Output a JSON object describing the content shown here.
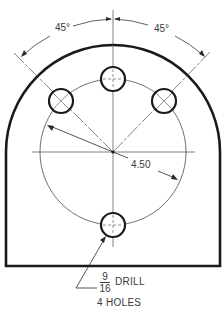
{
  "drawing": {
    "type": "engineering-drawing",
    "angle_labels": [
      "45°",
      "45°"
    ],
    "radius_label": "4.50",
    "note": {
      "fraction_numerator": "9",
      "fraction_denominator": "16",
      "operation": "DRILL",
      "quantity": "4 HOLES"
    },
    "colors": {
      "line": "#1a1a1a",
      "thin_line": "#4a4a4a",
      "text": "#3a3a3a",
      "background": "#ffffff"
    }
  }
}
